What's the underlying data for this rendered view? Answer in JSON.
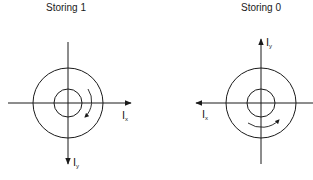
{
  "diagrams": [
    {
      "title": "Storing 1",
      "ix_label": "I",
      "ix_sub": "x",
      "iy_label": "I",
      "iy_sub": "y",
      "ix_direction": "right",
      "iy_direction": "down",
      "rotation": "clockwise"
    },
    {
      "title": "Storing 0",
      "ix_label": "I",
      "ix_sub": "x",
      "iy_label": "I",
      "iy_sub": "y",
      "ix_direction": "left",
      "iy_direction": "up",
      "rotation": "counterclockwise"
    }
  ],
  "colors": {
    "line": "#1a1a1a",
    "background": "#ffffff"
  }
}
